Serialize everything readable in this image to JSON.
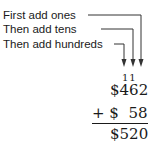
{
  "labels": {
    "ones": "First add ones",
    "tens": "Then add tens",
    "hundreds": "Then add hundreds"
  },
  "problem": {
    "carry": "11",
    "addend1": "$462",
    "addend2": "+ $  58",
    "sum": "$520"
  },
  "colors": {
    "ink": "#1a1a1a",
    "background": "#ffffff"
  }
}
